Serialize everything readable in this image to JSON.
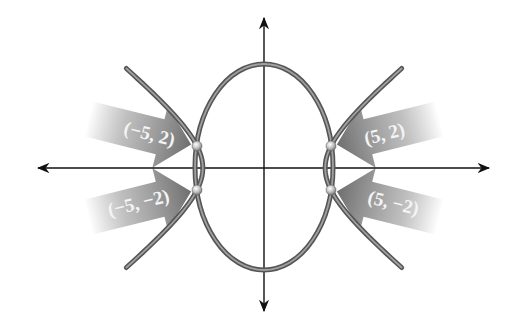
{
  "diagram": {
    "type": "conic-intersection",
    "axes": {
      "x_axis": {
        "arrows": "both"
      },
      "y_axis": {
        "arrows": "both"
      }
    },
    "curves": [
      {
        "name": "ellipse",
        "kind": "ellipse",
        "center": [
          0,
          0
        ]
      },
      {
        "name": "hyperbola",
        "kind": "hyperbola",
        "center": [
          0,
          0
        ],
        "opens": "left-right"
      }
    ],
    "intersection_points": [
      {
        "id": "p1",
        "label": "(−5, 2)",
        "x": -5,
        "y": 2
      },
      {
        "id": "p2",
        "label": "(5, 2)",
        "x": 5,
        "y": 2
      },
      {
        "id": "p3",
        "label": "(−5, −2)",
        "x": -5,
        "y": -2
      },
      {
        "id": "p4",
        "label": "(5, −2)",
        "x": 5,
        "y": -2
      }
    ],
    "colors": {
      "background": "#ffffff",
      "axis": "#111111",
      "curve_edge": "#555555",
      "curve_core": "#9a9a9a",
      "arrow_solid": "#7a7a7a",
      "label_text": "#f4f4f4"
    }
  }
}
